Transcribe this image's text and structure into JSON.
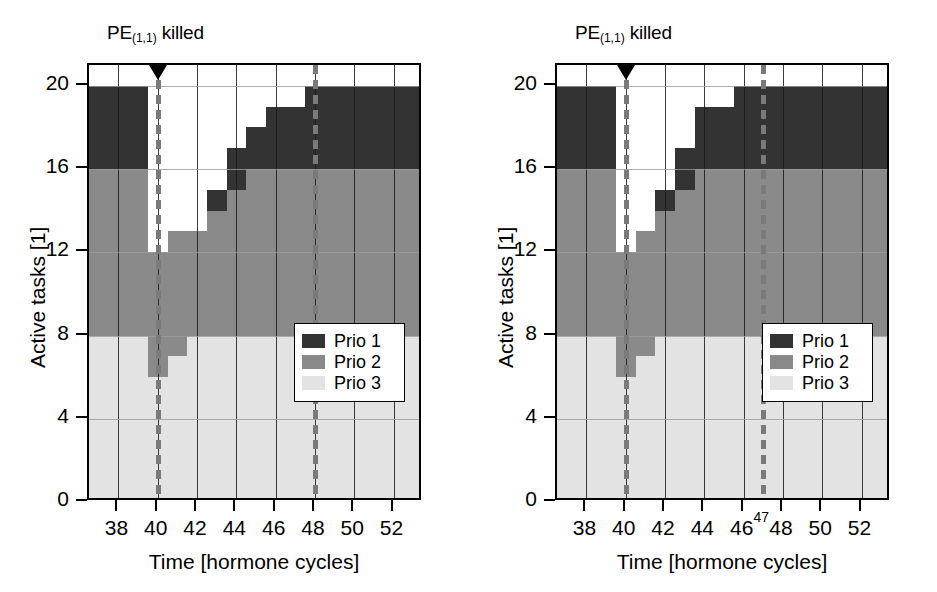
{
  "figure": {
    "width": 937,
    "height": 592,
    "background": "#ffffff"
  },
  "colors": {
    "prio1": "#333333",
    "prio2": "#8a8a8a",
    "prio3": "#e3e3e3",
    "empty": "#ffffff",
    "axis": "#000000",
    "grid_vertical": "#1a1a1a",
    "grid_horizontal": "#9a9a9a",
    "dashed_marker_line": "#7a7a7a",
    "kill_marker": "#000000"
  },
  "legend": {
    "position": "bottom-right",
    "entries": [
      {
        "label": "Prio 1",
        "color_key": "prio1"
      },
      {
        "label": "Prio 2",
        "color_key": "prio2"
      },
      {
        "label": "Prio 3",
        "color_key": "prio3"
      }
    ]
  },
  "panels": [
    {
      "id": "left",
      "title_prefix": "PE",
      "title_sub": "(1,1)",
      "title_suffix": " killed"
    },
    {
      "id": "right",
      "title_prefix": "PE",
      "title_sub": "(1,1)",
      "title_suffix": " killed"
    }
  ],
  "chart_data": [
    {
      "id": "left",
      "type": "area",
      "title": "PE(1,1) killed",
      "xlabel": "Time [hormone cycles]",
      "ylabel": "Active tasks [1]",
      "xlim": [
        36.5,
        53.5
      ],
      "ylim": [
        0,
        21
      ],
      "xticks": [
        38,
        40,
        42,
        44,
        46,
        48,
        50,
        52
      ],
      "xtick_labels": [
        "38",
        "40",
        "42",
        "44",
        "46",
        "48",
        "50",
        "52"
      ],
      "yticks": [
        0,
        4,
        8,
        12,
        16,
        20
      ],
      "ytick_labels": [
        "0",
        "4",
        "8",
        "12",
        "16",
        "20"
      ],
      "grid": "both",
      "legend_entries": [
        "Prio 1",
        "Prio 2",
        "Prio 3"
      ],
      "annotations": [
        {
          "text": "PE(1,1) killed",
          "type": "kill-marker",
          "x": 40,
          "marker": "triangle-down"
        },
        {
          "text": "",
          "type": "dashed-vline",
          "x": 40
        },
        {
          "text": "",
          "type": "dashed-vline",
          "x": 48
        }
      ],
      "x": [
        37,
        38,
        39,
        40,
        41,
        42,
        43,
        44,
        45,
        46,
        47,
        48,
        49,
        50,
        51,
        52,
        53
      ],
      "series": [
        {
          "name": "Prio 3",
          "values": [
            8,
            8,
            8,
            6,
            7,
            8,
            8,
            8,
            8,
            8,
            8,
            8,
            8,
            8,
            8,
            8,
            8
          ]
        },
        {
          "name": "Prio 2",
          "values": [
            8,
            8,
            8,
            6,
            6,
            5,
            6,
            7,
            8,
            8,
            8,
            8,
            8,
            8,
            8,
            8,
            8
          ]
        },
        {
          "name": "Prio 1",
          "values": [
            4,
            4,
            4,
            0,
            0,
            0,
            1,
            2,
            2,
            3,
            3,
            4,
            4,
            4,
            4,
            4,
            4
          ]
        }
      ],
      "cumulative_top": {
        "prio3_top": [
          8,
          8,
          8,
          6,
          7,
          8,
          8,
          8,
          8,
          8,
          8,
          8,
          8,
          8,
          8,
          8,
          8
        ],
        "prio2_top": [
          16,
          16,
          16,
          12,
          13,
          13,
          14,
          15,
          16,
          16,
          16,
          16,
          16,
          16,
          16,
          16,
          16
        ],
        "prio1_top": [
          20,
          20,
          20,
          12,
          13,
          13,
          15,
          17,
          18,
          19,
          19,
          20,
          20,
          20,
          20,
          20,
          20
        ]
      }
    },
    {
      "id": "right",
      "type": "area",
      "title": "PE(1,1) killed",
      "xlabel": "Time [hormone cycles]",
      "ylabel": "Active tasks [1]",
      "xlim": [
        36.5,
        53.5
      ],
      "ylim": [
        0,
        21
      ],
      "xticks": [
        38,
        40,
        42,
        44,
        46,
        48,
        50,
        52
      ],
      "xtick_labels": [
        "38",
        "40",
        "42",
        "44",
        "46",
        "48",
        "50",
        "52"
      ],
      "xticks_minor": [
        47
      ],
      "xtick_labels_minor": [
        "47"
      ],
      "yticks": [
        0,
        4,
        8,
        12,
        16,
        20
      ],
      "ytick_labels": [
        "0",
        "4",
        "8",
        "12",
        "16",
        "20"
      ],
      "grid": "both",
      "legend_entries": [
        "Prio 1",
        "Prio 2",
        "Prio 3"
      ],
      "annotations": [
        {
          "text": "PE(1,1) killed",
          "type": "kill-marker",
          "x": 40,
          "marker": "triangle-down"
        },
        {
          "text": "",
          "type": "dashed-vline",
          "x": 40
        },
        {
          "text": "",
          "type": "dashed-vline",
          "x": 47
        }
      ],
      "x": [
        37,
        38,
        39,
        40,
        41,
        42,
        43,
        44,
        45,
        46,
        47,
        48,
        49,
        50,
        51,
        52,
        53
      ],
      "series": [
        {
          "name": "Prio 3",
          "values": [
            8,
            8,
            8,
            6,
            7,
            8,
            8,
            8,
            8,
            8,
            8,
            8,
            8,
            8,
            8,
            8,
            8
          ]
        },
        {
          "name": "Prio 2",
          "values": [
            8,
            8,
            8,
            6,
            6,
            6,
            7,
            8,
            8,
            8,
            8,
            8,
            8,
            8,
            8,
            8,
            8
          ]
        },
        {
          "name": "Prio 1",
          "values": [
            4,
            4,
            4,
            0,
            0,
            1,
            2,
            3,
            3,
            4,
            4,
            4,
            4,
            4,
            4,
            4,
            4
          ]
        }
      ],
      "cumulative_top": {
        "prio3_top": [
          8,
          8,
          8,
          6,
          7,
          8,
          8,
          8,
          8,
          8,
          8,
          8,
          8,
          8,
          8,
          8,
          8
        ],
        "prio2_top": [
          16,
          16,
          16,
          12,
          13,
          14,
          15,
          16,
          16,
          16,
          16,
          16,
          16,
          16,
          16,
          16,
          16
        ],
        "prio1_top": [
          20,
          20,
          20,
          12,
          13,
          15,
          17,
          19,
          19,
          20,
          20,
          20,
          20,
          20,
          20,
          20,
          20
        ]
      }
    }
  ],
  "geometry": {
    "panel_width": 468,
    "axes": {
      "left": 87,
      "top": 63,
      "width": 334,
      "height": 437
    },
    "x_domain": [
      36.5,
      53.5
    ],
    "y_domain": [
      0,
      21
    ],
    "legend_box": {
      "right_offset": 16,
      "bottom_offset": 98,
      "width": 111,
      "height": 79
    }
  }
}
